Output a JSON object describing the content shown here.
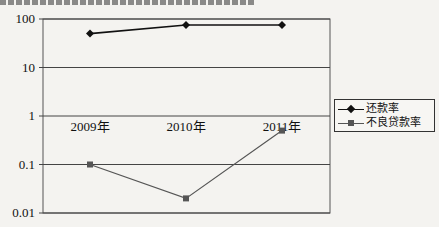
{
  "chart_data": {
    "type": "line",
    "title": "",
    "xlabel": "",
    "ylabel": "",
    "yscale": "log",
    "ylim": [
      0.01,
      100
    ],
    "yticks": [
      100,
      10,
      1,
      0.1,
      0.01
    ],
    "ytick_labels": [
      "100",
      "10",
      "1",
      "0.1",
      "0.01"
    ],
    "categories": [
      "2009年",
      "2010年",
      "2011年"
    ],
    "series": [
      {
        "name": "还款率",
        "marker": "diamond",
        "color": "#111111",
        "values": [
          50,
          75,
          75
        ]
      },
      {
        "name": "不良贷款率",
        "marker": "square",
        "color": "#555555",
        "values": [
          0.1,
          0.02,
          0.5
        ]
      }
    ],
    "grid": true,
    "legend_position": "right"
  },
  "legend": {
    "items": [
      {
        "label": "还款率"
      },
      {
        "label": "不良贷款率"
      }
    ]
  }
}
